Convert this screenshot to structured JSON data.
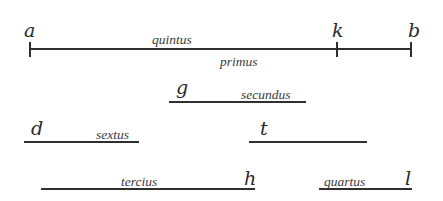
{
  "diagram": {
    "colors": {
      "ink": "#2f2f2f",
      "background": "#ffffff"
    },
    "main_line": {
      "points": {
        "a": "a",
        "k": "k",
        "b": "b"
      },
      "label_above": "quintus",
      "label_below": "primus"
    },
    "segments": [
      {
        "id": "g",
        "endpoint_label": "g",
        "label": "secundus"
      },
      {
        "id": "d",
        "endpoint_label": "d",
        "label": "sextus"
      },
      {
        "id": "t",
        "endpoint_label": "t",
        "label": ""
      },
      {
        "id": "h",
        "endpoint_label": "h",
        "label": "tercius"
      },
      {
        "id": "l",
        "endpoint_label": "l",
        "label": "quartus"
      }
    ]
  }
}
